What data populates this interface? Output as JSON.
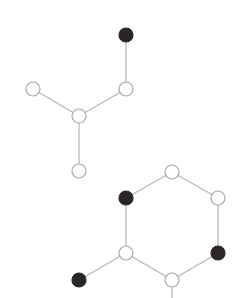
{
  "diagram": {
    "type": "molecular-graph",
    "colors": {
      "background": "#ffffff",
      "edge": "#b5b5b5",
      "open_node_stroke": "#a8a8a8",
      "open_node_fill": "#ffffff",
      "filled_node": "#2b2528"
    },
    "node_radius": 7,
    "nodes": [
      {
        "id": "a1",
        "x": 126,
        "y": 35,
        "filled": true
      },
      {
        "id": "a2",
        "x": 126,
        "y": 89,
        "filled": false
      },
      {
        "id": "a3",
        "x": 33,
        "y": 89,
        "filled": false
      },
      {
        "id": "a4",
        "x": 79,
        "y": 116,
        "filled": false
      },
      {
        "id": "a5",
        "x": 79,
        "y": 171,
        "filled": false
      },
      {
        "id": "h1",
        "x": 172,
        "y": 172,
        "filled": false
      },
      {
        "id": "h2",
        "x": 126,
        "y": 198,
        "filled": true
      },
      {
        "id": "h3",
        "x": 218,
        "y": 198,
        "filled": false
      },
      {
        "id": "h4",
        "x": 126,
        "y": 253,
        "filled": false
      },
      {
        "id": "h5",
        "x": 218,
        "y": 253,
        "filled": true
      },
      {
        "id": "h6",
        "x": 172,
        "y": 280,
        "filled": false
      },
      {
        "id": "p1",
        "x": 79,
        "y": 280,
        "filled": true
      }
    ],
    "edges": [
      [
        "a1",
        "a2"
      ],
      [
        "a2",
        "a4"
      ],
      [
        "a3",
        "a4"
      ],
      [
        "a4",
        "a5"
      ],
      [
        "h1",
        "h2"
      ],
      [
        "h1",
        "h3"
      ],
      [
        "h2",
        "h4"
      ],
      [
        "h3",
        "h5"
      ],
      [
        "h4",
        "h6"
      ],
      [
        "h5",
        "h6"
      ],
      [
        "h4",
        "p1"
      ]
    ],
    "stubs": [
      {
        "from": "h6",
        "x2": 172,
        "y2": 298
      }
    ]
  }
}
